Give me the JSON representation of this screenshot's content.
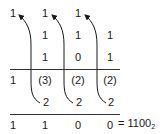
{
  "diagram": {
    "type": "binary-addition",
    "carry_row": [
      "1",
      "1",
      "1",
      ""
    ],
    "addend_1": [
      "",
      "1",
      "1",
      "1"
    ],
    "addend_2": [
      "",
      "1",
      "0",
      "1"
    ],
    "column_sums": [
      "1",
      "(3)",
      "(2)",
      "(2)"
    ],
    "carry_twos": [
      "",
      "2",
      "2",
      "2"
    ],
    "result_digits": [
      "1",
      "1",
      "0",
      "0"
    ],
    "result_equation": "= 1100",
    "result_base_subscript": "2"
  }
}
